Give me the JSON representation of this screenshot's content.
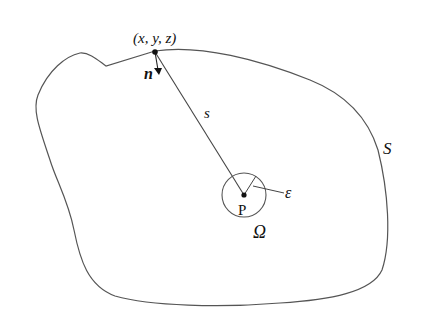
{
  "figure": {
    "type": "domain-boundary-diagram",
    "labels": {
      "surface_point": "(x, y, z)",
      "normal": "n",
      "distance": "s",
      "surface": "S",
      "interior_point": "P",
      "small_radius": "ε",
      "small_sphere": "Ω"
    },
    "colors": {
      "stroke": "#555555",
      "text": "#111111",
      "background": "#ffffff"
    }
  }
}
